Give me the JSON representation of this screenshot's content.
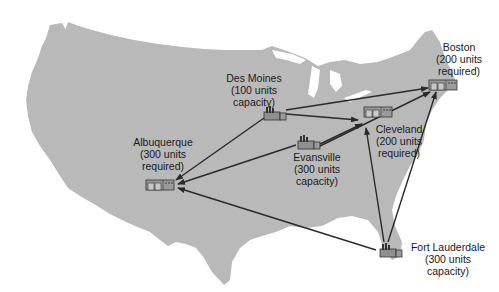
{
  "diagram": {
    "title": "",
    "map": "United States (contiguous)",
    "colors": {
      "land": "#b9b9b9",
      "arrow": "#2a2a2a",
      "icon": "#8f8f8f",
      "text": "#1a1a1a"
    },
    "nodes": [
      {
        "id": "des-moines",
        "type": "factory",
        "name": "Des Moines",
        "line2": "(100 units",
        "line3": "capacity)",
        "role": "source",
        "units": 100
      },
      {
        "id": "evansville",
        "type": "factory",
        "name": "Evansville",
        "line2": "(300 units",
        "line3": "capacity)",
        "role": "source",
        "units": 300
      },
      {
        "id": "fort-lauderdale",
        "type": "factory",
        "name": "Fort Lauderdale",
        "line2": "(300 units",
        "line3": "capacity)",
        "role": "source",
        "units": 300
      },
      {
        "id": "albuquerque",
        "type": "warehouse",
        "name": "Albuquerque",
        "line2": "(300 units",
        "line3": "required)",
        "role": "destination",
        "units": 300
      },
      {
        "id": "boston",
        "type": "warehouse",
        "name": "Boston",
        "line2": "(200 units",
        "line3": "required)",
        "role": "destination",
        "units": 200
      },
      {
        "id": "cleveland",
        "type": "warehouse",
        "name": "Cleveland",
        "line2": "(200 units",
        "line3": "required)",
        "role": "destination",
        "units": 200
      }
    ],
    "edges": [
      {
        "from": "des-moines",
        "to": "albuquerque"
      },
      {
        "from": "des-moines",
        "to": "cleveland"
      },
      {
        "from": "des-moines",
        "to": "boston"
      },
      {
        "from": "evansville",
        "to": "albuquerque"
      },
      {
        "from": "evansville",
        "to": "cleveland"
      },
      {
        "from": "evansville",
        "to": "boston"
      },
      {
        "from": "fort-lauderdale",
        "to": "albuquerque"
      },
      {
        "from": "fort-lauderdale",
        "to": "cleveland"
      },
      {
        "from": "fort-lauderdale",
        "to": "boston"
      }
    ]
  }
}
